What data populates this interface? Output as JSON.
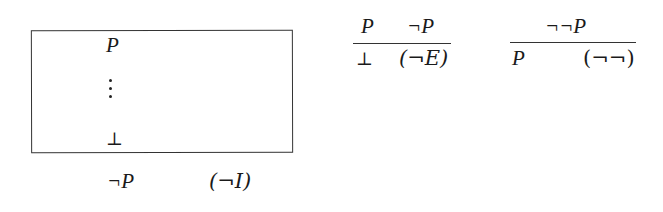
{
  "rules": {
    "neg_intro": {
      "assumption": "P",
      "ellipsis": "⋮",
      "derived": "⊥",
      "conclusion": "¬P",
      "label": "(¬I)"
    },
    "neg_elim": {
      "premise_1": "P",
      "premise_2": "¬P",
      "conclusion": "⊥",
      "label": "(¬E)"
    },
    "double_neg": {
      "premise": "¬¬P",
      "conclusion": "P",
      "label": "(¬¬)"
    }
  }
}
